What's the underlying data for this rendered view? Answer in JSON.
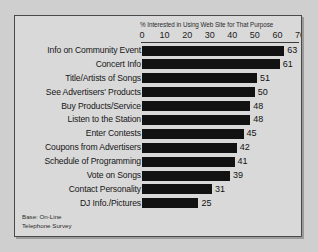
{
  "chart_data": {
    "type": "bar",
    "orientation": "horizontal",
    "title": "% Interested in Using Web Site for That Purpose",
    "xlabel": "",
    "ylabel": "",
    "xlim": [
      0,
      70
    ],
    "xticks": [
      0,
      10,
      20,
      30,
      40,
      50,
      60,
      70
    ],
    "grid": false,
    "legend": null,
    "bar_color": "#121212",
    "background_color": "#d9d9d9",
    "categories": [
      "Info on Community Event",
      "Concert Info",
      "Title/Artists of Songs",
      "See Advertisers' Products",
      "Buy Products/Service",
      "Listen to the Station",
      "Enter Contests",
      "Coupons from Advertisers",
      "Schedule of Programming",
      "Vote on Songs",
      "Contact Personality",
      "DJ Info./Pictures"
    ],
    "values": [
      63,
      61,
      51,
      50,
      48,
      48,
      45,
      42,
      41,
      39,
      31,
      25
    ],
    "annotation": "Base: On-Line\nTelephone Survey"
  }
}
